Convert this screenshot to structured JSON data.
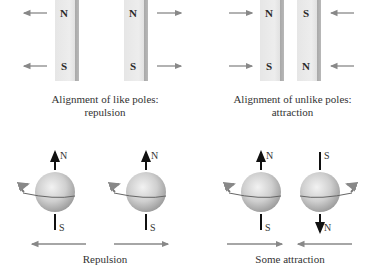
{
  "panels": {
    "like_poles": {
      "caption_line1": "Alignment of like poles:",
      "caption_line2": "repulsion",
      "magnets": [
        {
          "top": "N",
          "bottom": "S"
        },
        {
          "top": "N",
          "bottom": "S"
        }
      ]
    },
    "unlike_poles": {
      "caption_line1": "Alignment of unlike poles:",
      "caption_line2": "attraction",
      "magnets": [
        {
          "top": "N",
          "bottom": "S"
        },
        {
          "top": "S",
          "bottom": "N"
        }
      ]
    },
    "spin_repulsion": {
      "caption": "Repulsion",
      "spheres": [
        {
          "top": "N",
          "bottom": "S"
        },
        {
          "top": "N",
          "bottom": "S"
        }
      ]
    },
    "spin_attraction": {
      "caption": "Some attraction",
      "spheres": [
        {
          "top": "N",
          "bottom": "S"
        },
        {
          "top": "S",
          "bottom": "N"
        }
      ]
    }
  },
  "colors": {
    "arrow": "#888888",
    "sphere": "#bdbdbd",
    "text": "#333333"
  }
}
